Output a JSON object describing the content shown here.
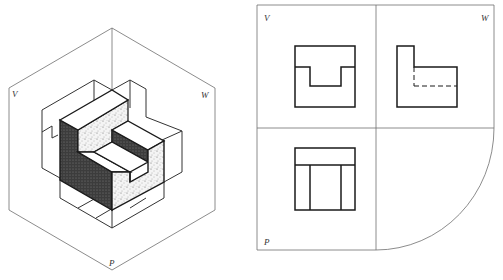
{
  "figure": {
    "isometric": {
      "labels": {
        "v": "V",
        "w": "W",
        "p": "P"
      }
    },
    "orthographic": {
      "labels": {
        "v": "V",
        "w": "W",
        "p": "P"
      },
      "views": [
        {
          "plane": "V",
          "name": "front view",
          "shape": "rectangle with U-notch on top"
        },
        {
          "plane": "W",
          "name": "side view",
          "shape": "L-shape with hidden dashed line"
        },
        {
          "plane": "P",
          "name": "top view",
          "shape": "rectangle with one horizontal and two vertical lines"
        }
      ]
    },
    "colors": {
      "outline": "#1a1a1a",
      "frame": "#6f6f6f",
      "dark_face": "#3a3a3a",
      "speckle_face": "#e8e8e8"
    }
  }
}
